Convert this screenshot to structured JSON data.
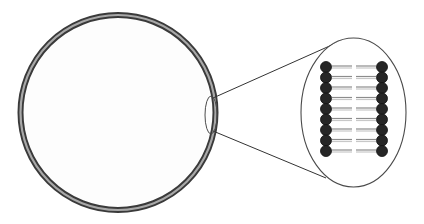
{
  "diagram": {
    "colors": {
      "background": "#ffffff",
      "cell_fill": "#fdfdfd",
      "membrane_outer": "#3a3a3a",
      "membrane_inner": "#a8a8a8",
      "line": "#333333",
      "ellipse_stroke": "#4a4a4a",
      "head_fill": "#262626",
      "head_stroke": "#111111",
      "tail_dark": "#8c8c8c",
      "tail_light": "#c8c8c8"
    },
    "cell": {
      "cx": 118,
      "cy": 112.5,
      "r": 97.5,
      "membrane_width": 6
    },
    "zoom_source": {
      "cx": 211,
      "cy": 115,
      "rx": 6,
      "ry": 19
    },
    "zoom_lines": [
      {
        "x1": 213,
        "y1": 98,
        "x2": 343,
        "y2": 40
      },
      {
        "x1": 213,
        "y1": 131,
        "x2": 326,
        "y2": 178
      }
    ],
    "zoom_view": {
      "cx": 353.5,
      "cy": 112.5,
      "rx": 52.5,
      "ry": 74.5
    },
    "bilayer": {
      "phospholipid_count_per_leaflet": 9,
      "head_radius": 5.5,
      "first_head_y": 67,
      "head_spacing": 10.5,
      "left_head_x": 326,
      "right_head_x": 382,
      "left_tail": {
        "x1": 332,
        "x2": 352
      },
      "right_tail": {
        "x1": 356,
        "x2": 376
      }
    }
  }
}
